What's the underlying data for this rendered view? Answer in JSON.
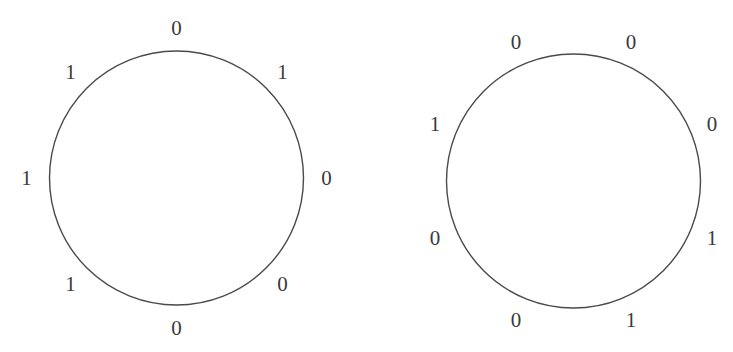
{
  "figure": {
    "background_color": "#ffffff",
    "stroke_color": "#4a4a4a",
    "text_color": "#3a3a3a",
    "label_font_size_px": 21
  },
  "chart_data": {
    "type": "scatter",
    "title": "",
    "subtitle": "",
    "xlabel": "",
    "ylabel": "",
    "grid": false,
    "legend": null,
    "series": [
      {
        "name": "left-circle",
        "center": [
          176.5,
          178
        ],
        "radius": 127,
        "label_radius": 150,
        "start_angle_deg": -90,
        "step_deg": 45,
        "values": [
          "0",
          "1",
          "0",
          "0",
          "0",
          "1",
          "1",
          "1"
        ]
      },
      {
        "name": "right-circle",
        "center": [
          573.5,
          181
        ],
        "radius": 127,
        "label_radius": 150,
        "start_angle_deg": -67.5,
        "step_deg": 45,
        "values": [
          "0",
          "0",
          "1",
          "1",
          "0",
          "0",
          "1",
          "0"
        ]
      }
    ]
  },
  "circles": [
    {
      "name": "left-circle",
      "center_x": 176.5,
      "center_y": 178,
      "radius": 127,
      "label_radius": 150,
      "start_angle_deg": -90,
      "step_deg": 45,
      "labels": [
        {
          "value": "0",
          "position": "top"
        },
        {
          "value": "1",
          "position": "upper-right"
        },
        {
          "value": "0",
          "position": "right"
        },
        {
          "value": "0",
          "position": "lower-right"
        },
        {
          "value": "0",
          "position": "bottom-right-of-bottom"
        },
        {
          "value": "1",
          "position": "bottom-left-of-bottom"
        },
        {
          "value": "1",
          "position": "left"
        },
        {
          "value": "1",
          "position": "upper-left"
        }
      ]
    },
    {
      "name": "right-circle",
      "center_x": 573.5,
      "center_y": 181,
      "radius": 127,
      "label_radius": 150,
      "start_angle_deg": -67.5,
      "step_deg": 45,
      "labels": [
        {
          "value": "0",
          "position": "top-right"
        },
        {
          "value": "0",
          "position": "upper-right"
        },
        {
          "value": "1",
          "position": "right"
        },
        {
          "value": "1",
          "position": "lower-right"
        },
        {
          "value": "0",
          "position": "bottom"
        },
        {
          "value": "0",
          "position": "lower-left"
        },
        {
          "value": "1",
          "position": "upper-left"
        },
        {
          "value": "0",
          "position": "left"
        }
      ]
    }
  ]
}
